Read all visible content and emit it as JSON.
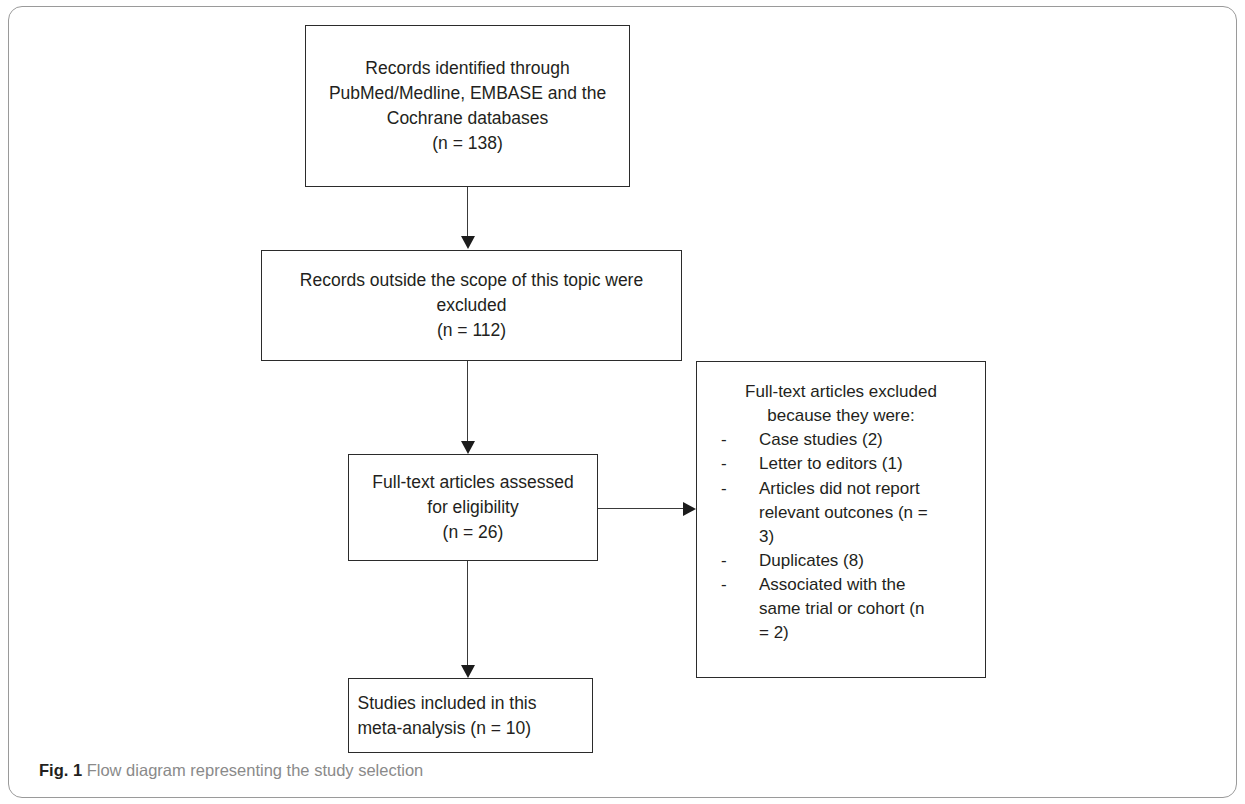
{
  "figure": {
    "caption_label": "Fig. 1",
    "caption_text": "Flow diagram representing the study selection"
  },
  "diagram": {
    "type": "flowchart",
    "nodes": {
      "identified": {
        "lines": [
          "Records identified through",
          "PubMed/Medline, EMBASE and the",
          "Cochrane databases",
          "(n = 138)"
        ]
      },
      "scope_excluded": {
        "lines": [
          "Records outside the scope of this topic were",
          "excluded",
          "(n = 112)"
        ]
      },
      "fulltext_assessed": {
        "lines": [
          "Full-text articles assessed",
          "for eligibility",
          "(n = 26)"
        ]
      },
      "fulltext_excluded": {
        "heading_lines": [
          "Full-text articles excluded",
          "because they were:"
        ],
        "bullet_marker": "-",
        "reasons": [
          {
            "lines": [
              "Case studies (2)"
            ]
          },
          {
            "lines": [
              "Letter to editors (1)"
            ]
          },
          {
            "lines": [
              "Articles did not report",
              "relevant outcones (n =",
              "3)"
            ]
          },
          {
            "lines": [
              "Duplicates (8)"
            ]
          },
          {
            "lines": [
              "Associated with the",
              "same trial or cohort (n",
              "= 2)"
            ]
          }
        ]
      },
      "included": {
        "lines": [
          "Studies included in this",
          "meta-analysis (n = 10)"
        ]
      }
    }
  }
}
